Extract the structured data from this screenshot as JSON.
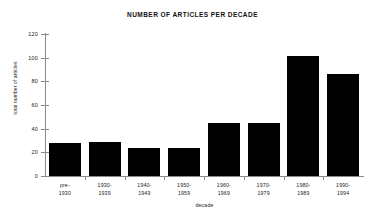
{
  "chart_data": {
    "type": "bar",
    "title": "NUMBER OF ARTICLES PER DECADE",
    "xlabel": "decade",
    "ylabel": "total number of articles",
    "categories": [
      "pre-\n1930",
      "1930-\n1939",
      "1940-\n1949",
      "1950-\n1959",
      "1960-\n1969",
      "1970-\n1979",
      "1980-\n1989",
      "1990-\n1994"
    ],
    "category_lines": [
      [
        "pre-",
        "1930"
      ],
      [
        "1930-",
        "1939"
      ],
      [
        "1940-",
        "1949"
      ],
      [
        "1950-",
        "1959"
      ],
      [
        "1960-",
        "1969"
      ],
      [
        "1970-",
        "1979"
      ],
      [
        "1980-",
        "1989"
      ],
      [
        "1990-",
        "1994"
      ]
    ],
    "values": [
      28,
      29,
      24,
      24,
      45,
      45,
      101,
      86
    ],
    "ylim": [
      0,
      120
    ],
    "yticks": [
      0,
      20,
      40,
      60,
      80,
      100,
      120
    ],
    "ytick_labels": [
      "0",
      "20",
      "40",
      "60",
      "80",
      "100",
      "120"
    ],
    "grid": false,
    "legend": null,
    "bar_color": "#000000",
    "axis_color": "#8a8a8a",
    "text_color": "#1a1a1a"
  },
  "axis": {
    "y_labels": [
      "120",
      "100",
      "80",
      "60",
      "40",
      "20",
      "0"
    ]
  }
}
